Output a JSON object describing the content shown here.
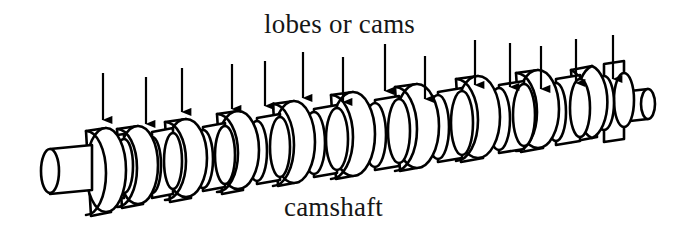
{
  "figure": {
    "title_visible": false,
    "background_color": "#ffffff",
    "ink_color": "#000000",
    "text_color": "#161616",
    "width": 679,
    "height": 244
  },
  "labels": {
    "top": "lobes or cams",
    "bottom": "camshaft"
  },
  "annotations": {
    "arrow_count": 15,
    "arrow_color": "#000000",
    "arrows": [
      {
        "x": 103,
        "top": 73,
        "tip": 131
      },
      {
        "x": 146,
        "top": 77,
        "tip": 135
      },
      {
        "x": 182,
        "top": 68,
        "tip": 123
      },
      {
        "x": 232,
        "top": 64,
        "tip": 120
      },
      {
        "x": 265,
        "top": 61,
        "tip": 117
      },
      {
        "x": 303,
        "top": 52,
        "tip": 109
      },
      {
        "x": 343,
        "top": 57,
        "tip": 113
      },
      {
        "x": 385,
        "top": 44,
        "tip": 102
      },
      {
        "x": 425,
        "top": 56,
        "tip": 110
      },
      {
        "x": 475,
        "top": 40,
        "tip": 96
      },
      {
        "x": 510,
        "top": 43,
        "tip": 98
      },
      {
        "x": 541,
        "top": 46,
        "tip": 100
      },
      {
        "x": 576,
        "top": 39,
        "tip": 94
      },
      {
        "x": 613,
        "top": 35,
        "tip": 90
      }
    ]
  },
  "camshaft": {
    "lobe_count": 15,
    "left_journal": {
      "label": "shaft-end-left"
    },
    "right_journal": {
      "label": "shaft-end-right"
    },
    "lobes": [
      {
        "x": 106,
        "y": 172,
        "rx": 20,
        "ry": 41,
        "w": 18,
        "type": "lobe"
      },
      {
        "x": 131,
        "y": 170,
        "rx": 14,
        "ry": 28,
        "w": 14,
        "type": "journal"
      },
      {
        "x": 150,
        "y": 166,
        "rx": 20,
        "ry": 40,
        "w": 20,
        "type": "lobe"
      },
      {
        "x": 183,
        "y": 162,
        "rx": 22,
        "ry": 42,
        "w": 20,
        "type": "lobe"
      },
      {
        "x": 214,
        "y": 158,
        "rx": 15,
        "ry": 30,
        "w": 13,
        "type": "journal"
      },
      {
        "x": 236,
        "y": 154,
        "rx": 21,
        "ry": 40,
        "w": 20,
        "type": "lobe"
      },
      {
        "x": 268,
        "y": 150,
        "rx": 16,
        "ry": 31,
        "w": 14,
        "type": "journal"
      },
      {
        "x": 293,
        "y": 144,
        "rx": 23,
        "ry": 43,
        "w": 21,
        "type": "lobe"
      },
      {
        "x": 327,
        "y": 142,
        "rx": 16,
        "ry": 32,
        "w": 14,
        "type": "journal"
      },
      {
        "x": 352,
        "y": 136,
        "rx": 23,
        "ry": 43,
        "w": 22,
        "type": "lobe"
      },
      {
        "x": 388,
        "y": 134,
        "rx": 17,
        "ry": 33,
        "w": 15,
        "type": "journal"
      },
      {
        "x": 416,
        "y": 128,
        "rx": 23,
        "ry": 42,
        "w": 22,
        "type": "lobe"
      },
      {
        "x": 451,
        "y": 124,
        "rx": 17,
        "ry": 33,
        "w": 16,
        "type": "journal"
      },
      {
        "x": 478,
        "y": 118,
        "rx": 23,
        "ry": 42,
        "w": 22,
        "type": "lobe"
      },
      {
        "x": 512,
        "y": 116,
        "rx": 17,
        "ry": 32,
        "w": 15,
        "type": "journal"
      },
      {
        "x": 538,
        "y": 110,
        "rx": 22,
        "ry": 40,
        "w": 20,
        "type": "lobe"
      },
      {
        "x": 568,
        "y": 108,
        "rx": 16,
        "ry": 30,
        "w": 14,
        "type": "journal"
      },
      {
        "x": 592,
        "y": 102,
        "rx": 21,
        "ry": 38,
        "w": 18,
        "type": "lobe"
      },
      {
        "x": 620,
        "y": 100,
        "rx": 15,
        "ry": 28,
        "w": 13,
        "type": "journal"
      }
    ]
  }
}
